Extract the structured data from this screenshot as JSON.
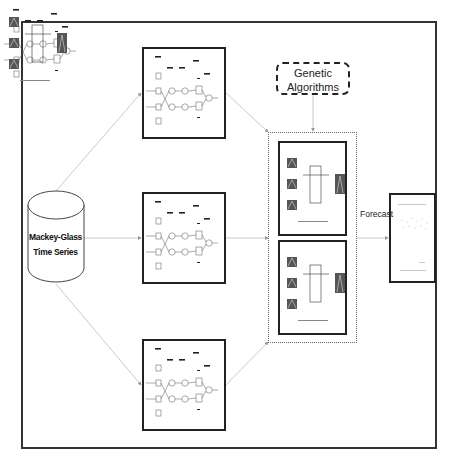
{
  "diagram": {
    "title": "",
    "source": {
      "label_line1": "Mackey-Glass",
      "label_line2": "Time Series",
      "shape": "cylinder"
    },
    "networks": [
      {
        "id": "net-top",
        "layers": [
          "Layer 1",
          "Layer 2",
          "Layer 3",
          "Layer 4",
          "Layer 5"
        ]
      },
      {
        "id": "net-middle",
        "layers": [
          "Layer 1",
          "Layer 2",
          "Layer 3",
          "Layer 4",
          "Layer 5"
        ]
      },
      {
        "id": "net-bottom",
        "layers": [
          "Layer 1",
          "Layer 2",
          "Layer 3",
          "Layer 4",
          "Layer 5"
        ]
      }
    ],
    "optimizer": {
      "label_line1": "Genetic",
      "label_line2": "Algorithms"
    },
    "fuzzy_integrators": [
      {
        "id": "integrator-1",
        "caption": "Type-1 fuzzy integrator"
      },
      {
        "id": "integrator-2",
        "caption": "Type-2 fuzzy integrator"
      }
    ],
    "output": {
      "edge_label": "Forecast",
      "shape": "plot-page"
    },
    "colors": {
      "stroke": "#222222",
      "arrow": "#aaaaaa",
      "background": "#ffffff"
    }
  }
}
